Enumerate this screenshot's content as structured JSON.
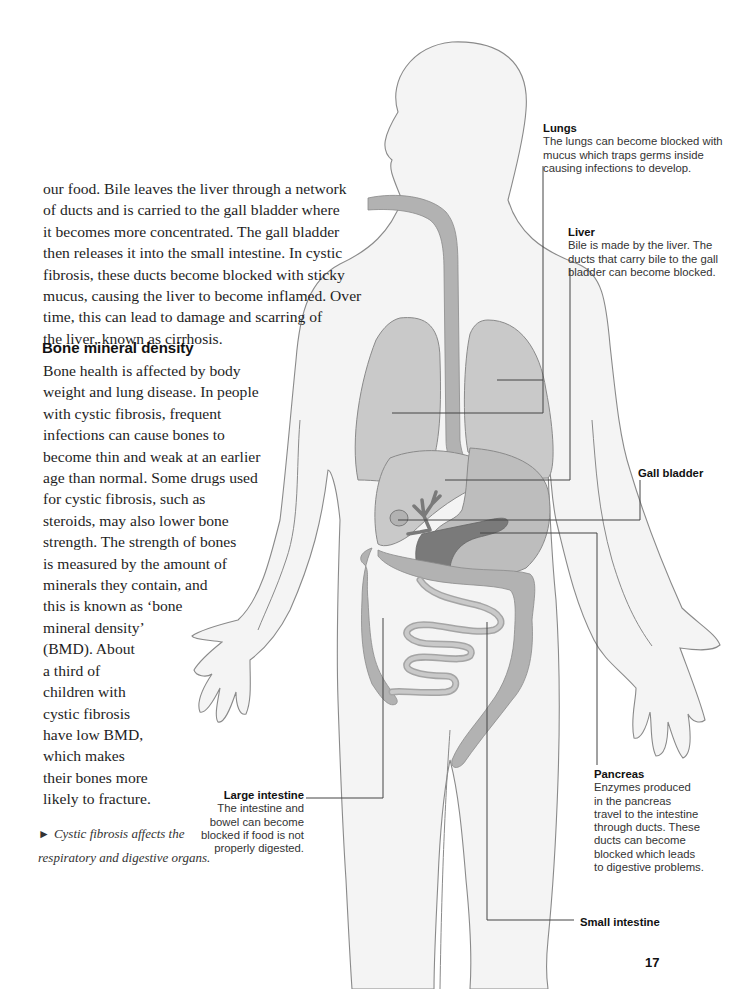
{
  "intro": {
    "lines": [
      "our food. Bile leaves the liver through a network",
      "of ducts and is carried to the gall bladder where",
      "it becomes more concentrated. The gall bladder",
      "then releases it into the small intestine. In cystic",
      "fibrosis, these ducts become blocked with sticky",
      "mucus, causing the liver to become inflamed. Over",
      "time, this can lead to damage and scarring of",
      "the liver, known as cirrhosis."
    ]
  },
  "bone_section": {
    "heading": "Bone mineral density",
    "lines": [
      "Bone health is affected by body",
      "weight and lung disease. In people",
      "with cystic fibrosis, frequent",
      "infections can cause bones to",
      "become thin and weak at an earlier",
      "age than normal. Some drugs used",
      "for cystic fibrosis, such as",
      "steroids, may also lower bone",
      "strength. The strength of bones",
      "is measured by the amount of",
      "minerals they contain, and",
      "this is known as ‘bone",
      "mineral density’",
      "(BMD). About",
      "a third of",
      "children with",
      "cystic fibrosis",
      "have low BMD,",
      "which makes",
      "their bones more",
      "likely to fracture."
    ]
  },
  "caption": {
    "arrow": "►",
    "lines": [
      "Cystic fibrosis affects the",
      "respiratory and digestive organs."
    ]
  },
  "labels": {
    "lungs": {
      "title": "Lungs",
      "lines": [
        "The lungs can become blocked with",
        "mucus which traps germs inside",
        "causing infections to develop."
      ]
    },
    "liver": {
      "title": "Liver",
      "lines": [
        "Bile is made by the liver. The",
        "ducts that carry bile to the gall",
        "bladder can become blocked."
      ]
    },
    "gall_bladder": {
      "title": "Gall bladder"
    },
    "pancreas": {
      "title": "Pancreas",
      "lines": [
        "Enzymes produced",
        "in the pancreas",
        "travel to the intestine",
        "through ducts. These",
        "ducts can become",
        "blocked which leads",
        "to digestive problems."
      ]
    },
    "large_intestine": {
      "title": "Large intestine",
      "lines": [
        "The intestine and",
        "bowel can become",
        "blocked if food is not",
        "properly digested."
      ]
    },
    "small_intestine": {
      "title": "Small intestine"
    }
  },
  "page_number": "17",
  "colors": {
    "body_fill": "#f4f4f4",
    "outline": "#8a8a8a",
    "organ_light": "#c9c9c9",
    "organ_mid": "#aaaaaa",
    "organ_dark": "#7a7a7a",
    "leader_line": "#444444"
  }
}
